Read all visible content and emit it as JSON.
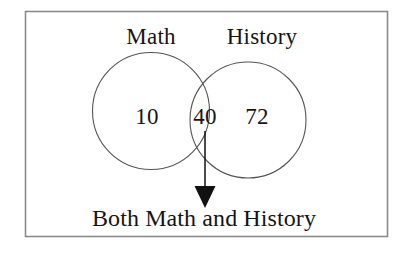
{
  "figure": {
    "type": "venn-diagram",
    "sets": [
      {
        "id": "math",
        "label": "Math"
      },
      {
        "id": "history",
        "label": "History"
      }
    ],
    "regions": [
      {
        "id": "math-only",
        "label": "Math only",
        "value": "10"
      },
      {
        "id": "both",
        "label": "Both Math and History",
        "value": "40"
      },
      {
        "id": "history-only",
        "label": "History only",
        "value": "72"
      }
    ],
    "annotation": {
      "target_region": "both",
      "caption": "Both Math and History",
      "arrow": "down-arrow-icon"
    },
    "colors": {
      "background": "#ffffff",
      "frame": "#8a8a8a",
      "circle_stroke": "#555555",
      "text": "#151515",
      "arrow": "#111111"
    }
  }
}
